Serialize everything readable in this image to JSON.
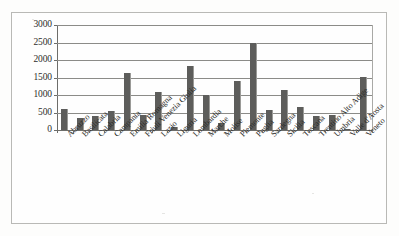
{
  "chart_data": {
    "type": "bar",
    "title": "",
    "subtitle": "",
    "xlabel": "",
    "ylabel": "",
    "ylim": [
      0,
      3000
    ],
    "ytick_labels": [
      "3000",
      "2500",
      "2000",
      "1500",
      "1000",
      "500",
      "0"
    ],
    "ytick_values": [
      3000,
      2500,
      2000,
      1500,
      1000,
      500,
      0
    ],
    "ytick_interval": 500,
    "grid": true,
    "legend": false,
    "legend_position": "none",
    "bar_color": "#5d5d5b",
    "grid_color": "#8b8b88",
    "axis_color": "#6d6d6a",
    "categories": [
      "Abruzzo",
      "Basilicata",
      "Calabria",
      "Campania",
      "Emilia Romagna",
      "Friuli Venezia Giulia",
      "Lazio",
      "Liguria",
      "Lombardia",
      "Marche",
      "Molise",
      "Piemonte",
      "Puglia",
      "Sardegna",
      "Sicilia",
      "Toscana",
      "Trentino Alto Adige",
      "Umbria",
      "Valle d'Aosta",
      "Veneto"
    ],
    "values": [
      610,
      330,
      390,
      545,
      1615,
      415,
      1075,
      80,
      1830,
      1010,
      190,
      1390,
      2480,
      580,
      1135,
      660,
      410,
      440,
      12,
      1525
    ]
  }
}
